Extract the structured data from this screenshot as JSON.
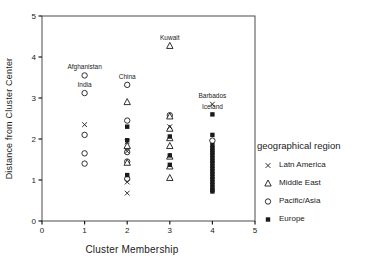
{
  "chart_data": {
    "type": "scatter",
    "title": "",
    "xlabel": "Cluster Membership",
    "ylabel": "Distance from Cluster Center",
    "xlim": [
      0,
      5
    ],
    "ylim": [
      0,
      5
    ],
    "xticks": [
      0,
      1,
      2,
      3,
      4,
      5
    ],
    "yticks": [
      0,
      1,
      2,
      3,
      4,
      5
    ],
    "grid": false,
    "frame": true,
    "marker_color": "#1a1a1a",
    "frame_color": "#4a4a4a",
    "legend": {
      "title": "geographical region",
      "position": "right"
    },
    "series": [
      {
        "name": "Latn America",
        "marker": "x",
        "points": [
          [
            1,
            2.35
          ],
          [
            2,
            1.93
          ],
          [
            2,
            1.7
          ],
          [
            2,
            0.95
          ],
          [
            2,
            0.68
          ],
          [
            3,
            2.3
          ],
          [
            4,
            2.85
          ]
        ]
      },
      {
        "name": "Middle East",
        "marker": "triangle-open",
        "points": [
          [
            3,
            4.27
          ],
          [
            2,
            2.9
          ],
          [
            2,
            1.83
          ],
          [
            2,
            1.42
          ],
          [
            3,
            2.55
          ],
          [
            3,
            2.25
          ],
          [
            3,
            2.02
          ],
          [
            3,
            1.83
          ],
          [
            3,
            1.57
          ],
          [
            3,
            1.33
          ],
          [
            3,
            1.05
          ]
        ]
      },
      {
        "name": "Pacific/Asia",
        "marker": "circle-open",
        "points": [
          [
            1,
            3.55
          ],
          [
            1,
            3.12
          ],
          [
            1,
            2.1
          ],
          [
            1,
            1.65
          ],
          [
            1,
            1.4
          ],
          [
            2,
            3.32
          ],
          [
            2,
            2.45
          ],
          [
            2,
            1.68
          ],
          [
            2,
            1.45
          ],
          [
            2,
            1.03
          ],
          [
            3,
            2.58
          ],
          [
            4,
            1.96
          ]
        ]
      },
      {
        "name": "Europe",
        "marker": "square-filled",
        "points": [
          [
            2,
            2.3
          ],
          [
            2,
            1.97
          ],
          [
            2,
            1.12
          ],
          [
            3,
            2.06
          ],
          [
            3,
            1.6
          ],
          [
            3,
            1.37
          ],
          [
            4,
            2.6
          ],
          [
            4,
            2.1
          ],
          [
            4,
            1.85
          ],
          [
            4,
            1.78
          ],
          [
            4,
            1.72
          ],
          [
            4,
            1.66
          ],
          [
            4,
            1.6
          ],
          [
            4,
            1.53
          ],
          [
            4,
            1.47
          ],
          [
            4,
            1.41
          ],
          [
            4,
            1.34
          ],
          [
            4,
            1.28
          ],
          [
            4,
            1.21
          ],
          [
            4,
            1.15
          ],
          [
            4,
            1.08
          ],
          [
            4,
            1.02
          ],
          [
            4,
            0.95
          ],
          [
            4,
            0.89
          ],
          [
            4,
            0.82
          ],
          [
            4,
            0.76
          ],
          [
            4,
            0.72
          ]
        ]
      }
    ],
    "annotations": [
      {
        "text": "Afghanistan",
        "x": 1,
        "y": 3.55,
        "dy": -6
      },
      {
        "text": "India",
        "x": 1,
        "y": 3.12,
        "dy": -6
      },
      {
        "text": "China",
        "x": 2,
        "y": 3.32,
        "dy": -6
      },
      {
        "text": "Kuwait",
        "x": 3,
        "y": 4.27,
        "dy": -6
      },
      {
        "text": "Barbados",
        "x": 4,
        "y": 2.85,
        "dy": -6
      },
      {
        "text": "Iceland",
        "x": 4,
        "y": 2.6,
        "dy": -5
      }
    ]
  }
}
